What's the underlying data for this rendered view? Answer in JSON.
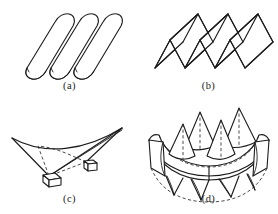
{
  "figure": {
    "background_color": "#ffffff",
    "line_color": "#1c1c1c",
    "hidden_line_color": "#2a2a2a",
    "panel_count": 4,
    "layout": "2x2"
  },
  "panels": [
    {
      "key": "a",
      "caption": "(a)",
      "subject": "barrel-vault-shell",
      "unit_count": 3,
      "hidden_lines": false
    },
    {
      "key": "b",
      "caption": "(b)",
      "subject": "folded-plate-shell",
      "unit_count": 3,
      "hidden_lines": false
    },
    {
      "key": "c",
      "caption": "(c)",
      "subject": "hyperbolic-paraboloid-saddle-shell",
      "support_block_count": 2,
      "hidden_lines": true
    },
    {
      "key": "d",
      "caption": "(d)",
      "subject": "hypar-umbrella-crown-shell",
      "peak_count": 4,
      "hidden_lines": true
    }
  ]
}
